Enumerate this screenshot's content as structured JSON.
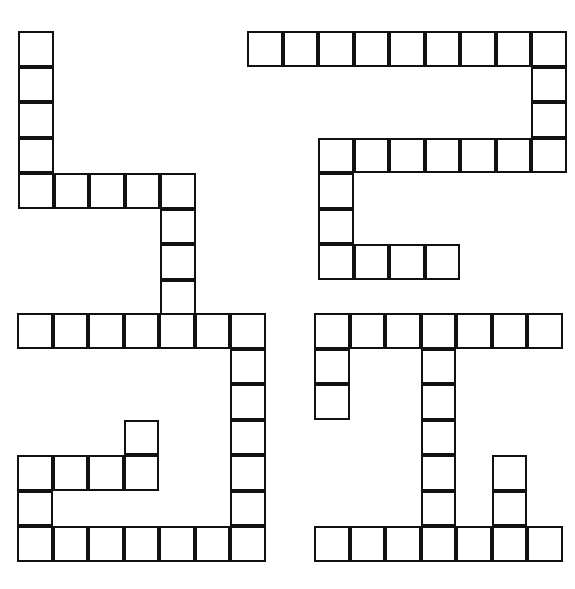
{
  "page": {
    "background_color": "#ffffff",
    "line_color": "#111111",
    "fill_color": "#ffffff",
    "width": 575,
    "height": 589,
    "cell_size": 35.5,
    "line_width": 2.2,
    "shape_count": 4
  },
  "shapes": [
    {
      "id": "shape-top-left",
      "name": "top-left-piece",
      "description": "L-shaped zigzag: vertical arm of 4 cells, horizontal arm of 5 cells, descending tail of 3 cells",
      "origin_x": 18,
      "origin_y": 31,
      "cell_count": 12,
      "cols": 5,
      "rows": 8,
      "cells": [
        [
          0,
          0
        ],
        [
          0,
          1
        ],
        [
          0,
          2
        ],
        [
          0,
          3
        ],
        [
          0,
          4
        ],
        [
          1,
          4
        ],
        [
          2,
          4
        ],
        [
          3,
          4
        ],
        [
          4,
          4
        ],
        [
          4,
          5
        ],
        [
          4,
          6
        ],
        [
          4,
          7
        ]
      ]
    },
    {
      "id": "shape-top-right",
      "name": "top-right-piece",
      "description": "Double-hook spiral: top row of 9 cells, right column drop of 2, middle row of 7 cells, left column drop of 2, bottom row of 4 cells",
      "origin_x": 247,
      "origin_y": 31,
      "cell_count": 24,
      "cols": 9,
      "rows": 7,
      "cells": [
        [
          0,
          0
        ],
        [
          1,
          0
        ],
        [
          2,
          0
        ],
        [
          3,
          0
        ],
        [
          4,
          0
        ],
        [
          5,
          0
        ],
        [
          6,
          0
        ],
        [
          7,
          0
        ],
        [
          8,
          0
        ],
        [
          8,
          1
        ],
        [
          8,
          2
        ],
        [
          2,
          3
        ],
        [
          3,
          3
        ],
        [
          4,
          3
        ],
        [
          5,
          3
        ],
        [
          6,
          3
        ],
        [
          7,
          3
        ],
        [
          8,
          3
        ],
        [
          2,
          4
        ],
        [
          2,
          5
        ],
        [
          2,
          6
        ],
        [
          3,
          6
        ],
        [
          4,
          6
        ],
        [
          5,
          6
        ]
      ]
    },
    {
      "id": "shape-bottom-left",
      "name": "bottom-left-piece",
      "description": "Inward spiral: top row of 7, right column of 6, bottom row of 7, left column of 2, inner row of 4 and inner column of 2",
      "origin_x": 17,
      "origin_y": 313,
      "cell_count": 24,
      "cols": 7,
      "rows": 7,
      "cells": [
        [
          0,
          0
        ],
        [
          1,
          0
        ],
        [
          2,
          0
        ],
        [
          3,
          0
        ],
        [
          4,
          0
        ],
        [
          5,
          0
        ],
        [
          6,
          0
        ],
        [
          6,
          1
        ],
        [
          6,
          2
        ],
        [
          6,
          3
        ],
        [
          6,
          4
        ],
        [
          6,
          5
        ],
        [
          6,
          6
        ],
        [
          0,
          6
        ],
        [
          1,
          6
        ],
        [
          2,
          6
        ],
        [
          3,
          6
        ],
        [
          4,
          6
        ],
        [
          5,
          6
        ],
        [
          0,
          4
        ],
        [
          0,
          5
        ],
        [
          1,
          4
        ],
        [
          2,
          4
        ],
        [
          3,
          4
        ],
        [
          3,
          3
        ]
      ]
    },
    {
      "id": "shape-bottom-right",
      "name": "bottom-right-piece",
      "description": "I-beam / H-like form: top row of 7, left column stub of 2, central stem column of 5, right column stub of 2, bottom row of 7",
      "origin_x": 314,
      "origin_y": 313,
      "cell_count": 23,
      "cols": 7,
      "rows": 7,
      "cells": [
        [
          0,
          0
        ],
        [
          1,
          0
        ],
        [
          2,
          0
        ],
        [
          3,
          0
        ],
        [
          4,
          0
        ],
        [
          5,
          0
        ],
        [
          6,
          0
        ],
        [
          0,
          1
        ],
        [
          0,
          2
        ],
        [
          3,
          1
        ],
        [
          3,
          2
        ],
        [
          3,
          3
        ],
        [
          3,
          4
        ],
        [
          3,
          5
        ],
        [
          5,
          4
        ],
        [
          5,
          5
        ],
        [
          0,
          6
        ],
        [
          1,
          6
        ],
        [
          2,
          6
        ],
        [
          3,
          6
        ],
        [
          4,
          6
        ],
        [
          5,
          6
        ],
        [
          6,
          6
        ]
      ]
    }
  ]
}
